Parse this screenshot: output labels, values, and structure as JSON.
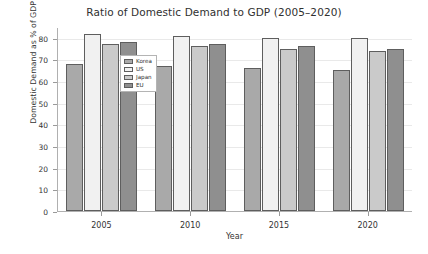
{
  "chart_data": {
    "type": "bar",
    "title": "Ratio of Domestic Demand to GDP (2005–2020)",
    "xlabel": "Year",
    "ylabel": "Domestic Demand as % of GDP",
    "categories": [
      "2005",
      "2010",
      "2015",
      "2020"
    ],
    "series": [
      {
        "name": "Korea",
        "color": "#a9a9a9",
        "values": [
          68,
          67,
          66,
          65
        ]
      },
      {
        "name": "US",
        "color": "#f1f1f1",
        "values": [
          82,
          81,
          80,
          80
        ]
      },
      {
        "name": "Japan",
        "color": "#cacaca",
        "values": [
          77,
          76,
          75,
          74
        ]
      },
      {
        "name": "EU",
        "color": "#8f8f8f",
        "values": [
          78,
          77,
          76,
          75
        ]
      }
    ],
    "ylim": [
      0,
      85
    ],
    "yticks": [
      0,
      10,
      20,
      30,
      40,
      50,
      60,
      70,
      80
    ],
    "ytick_labels": [
      "0",
      "10",
      "20",
      "30",
      "40",
      "50",
      "60",
      "70",
      "80"
    ],
    "grid": true,
    "legend_position": "upper left"
  }
}
